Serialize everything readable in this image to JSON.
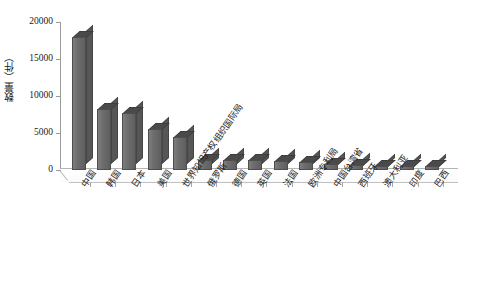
{
  "chart_data": {
    "type": "bar",
    "title": "",
    "subtitle": "",
    "xlabel": "",
    "ylabel": "数量（件）",
    "ylim": [
      0,
      20000
    ],
    "ytick_labels": [
      "0",
      "5000",
      "10000",
      "15000",
      "20000"
    ],
    "ytick_values": [
      0,
      5000,
      10000,
      15000,
      20000
    ],
    "grid": false,
    "legend": false,
    "style": "3d-column",
    "bar_color": "#6b6b6b",
    "bar_top_color": "#4a4a4a",
    "bar_side_color": "#565656",
    "categories": [
      "中国",
      "韩国",
      "日本",
      "美国",
      "世界知识产权组织国际局",
      "俄罗斯",
      "德国",
      "英国",
      "法国",
      "欧洲专利局",
      "中国台湾省",
      "西班牙",
      "澳大利亚",
      "印度",
      "巴西"
    ],
    "values": [
      18000,
      8200,
      7700,
      5500,
      4500,
      1400,
      1350,
      1300,
      1250,
      1100,
      800,
      650,
      600,
      550,
      500
    ]
  }
}
